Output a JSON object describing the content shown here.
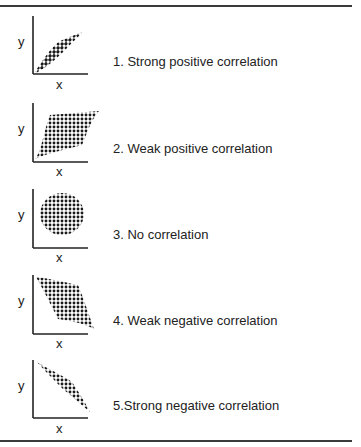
{
  "figure": {
    "axis_labels": {
      "x": "x",
      "y": "y"
    },
    "panels": [
      {
        "id": 1,
        "caption": "1. Strong positive correlation",
        "shape": "narrow-ellipse-rising"
      },
      {
        "id": 2,
        "caption": "2. Weak positive correlation",
        "shape": "parallelogram-rising"
      },
      {
        "id": 3,
        "caption": "3. No correlation",
        "shape": "circle"
      },
      {
        "id": 4,
        "caption": "4. Weak negative correlation",
        "shape": "parallelogram-falling"
      },
      {
        "id": 5,
        "caption": "5.Strong negative correlation",
        "shape": "narrow-ellipse-falling"
      }
    ],
    "colors": {
      "rule": "#3a3a3a",
      "dots": "#1a1a1a",
      "axis": "#222222"
    }
  }
}
